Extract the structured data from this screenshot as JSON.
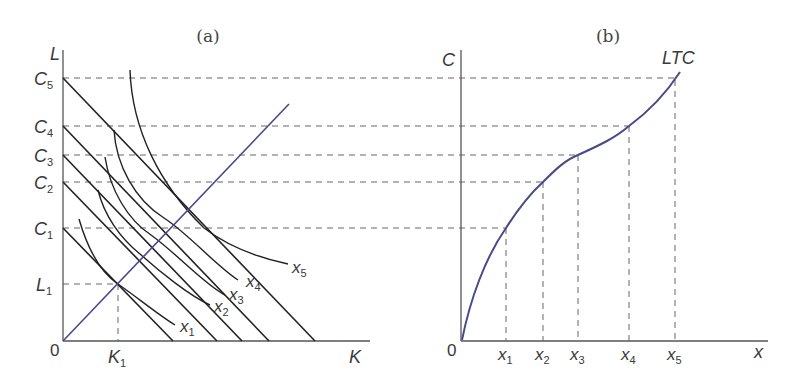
{
  "panels": {
    "a": {
      "title": "(a)",
      "y_axis_label": "L",
      "x_axis_label": "K",
      "origin_label": "0",
      "cost_labels": [
        {
          "base": "C",
          "sub": "5"
        },
        {
          "base": "C",
          "sub": "4"
        },
        {
          "base": "C",
          "sub": "3"
        },
        {
          "base": "C",
          "sub": "2"
        },
        {
          "base": "C",
          "sub": "1"
        }
      ],
      "l1_label": {
        "base": "L",
        "sub": "1"
      },
      "k1_label": {
        "base": "K",
        "sub": "1"
      },
      "isoquant_labels": [
        {
          "base": "x",
          "sub": "1"
        },
        {
          "base": "x",
          "sub": "2"
        },
        {
          "base": "x",
          "sub": "3"
        },
        {
          "base": "x",
          "sub": "4"
        },
        {
          "base": "x",
          "sub": "5"
        }
      ],
      "expansion_path_color": "#4a4a8a"
    },
    "b": {
      "title": "(b)",
      "y_axis_label": "C",
      "x_axis_label": "x",
      "origin_label": "0",
      "curve_label": "LTC",
      "output_labels": [
        {
          "base": "x",
          "sub": "1"
        },
        {
          "base": "x",
          "sub": "2"
        },
        {
          "base": "x",
          "sub": "3"
        },
        {
          "base": "x",
          "sub": "4"
        },
        {
          "base": "x",
          "sub": "5"
        }
      ],
      "curve_color": "#4a4a8a"
    }
  },
  "colors": {
    "axis": "#555555",
    "line": "#222222",
    "dash": "#666666",
    "blue": "#4a4a8a"
  }
}
